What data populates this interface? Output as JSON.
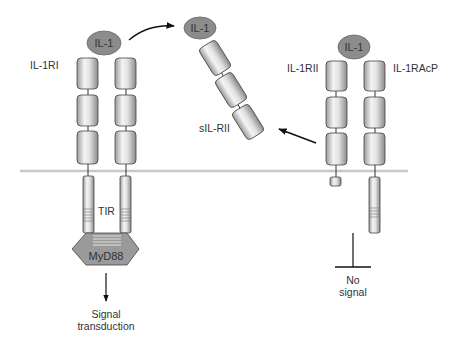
{
  "diagram": {
    "colors": {
      "ligand_fill": "#8c8c8c",
      "membrane": "#c8c8c8",
      "domain_stroke": "#444444",
      "text": "#333333",
      "myd88_fill": "#9a9a9a"
    },
    "labels": {
      "il1_left": "IL-1",
      "il1_soluble": "IL-1",
      "il1_right": "IL-1",
      "il1ri": "IL-1RI",
      "il1rii": "IL-1RII",
      "il1racp": "IL-1RAcP",
      "sil_rii": "sIL-RII",
      "tir": "TIR",
      "myd88": "MyD88",
      "signal_line1": "Signal",
      "signal_line2": "transduction",
      "nosignal_line1": "No",
      "nosignal_line2": "signal"
    }
  }
}
